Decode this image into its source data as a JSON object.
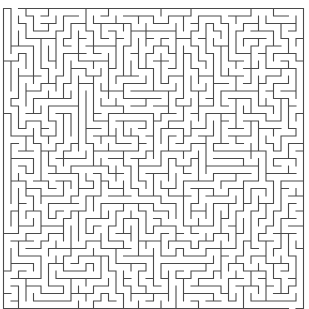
{
  "maze": {
    "cols": 40,
    "rows": 40,
    "origin_x": 3.5,
    "origin_y": 8.5,
    "cell_size": 7.5,
    "wall_color": "#4a4a4a",
    "background_color": "#ffffff",
    "entrance": {
      "side": "top",
      "col": 1
    },
    "exit": {
      "side": "bottom",
      "col": 38
    },
    "seed": 20240517
  }
}
